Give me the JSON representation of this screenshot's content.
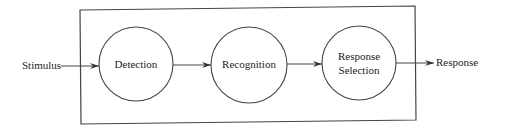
{
  "diagram": {
    "type": "flow",
    "input": {
      "label": "Stimulus"
    },
    "output": {
      "label": "Response"
    },
    "stages": [
      {
        "id": "detection",
        "lines": [
          "Detection"
        ]
      },
      {
        "id": "recognition",
        "lines": [
          "Recognition"
        ]
      },
      {
        "id": "response-selection",
        "lines": [
          "Response",
          "Selection"
        ]
      }
    ],
    "edges": [
      {
        "from": "Stimulus",
        "to": "Detection"
      },
      {
        "from": "Detection",
        "to": "Recognition"
      },
      {
        "from": "Recognition",
        "to": "Response Selection"
      },
      {
        "from": "Response Selection",
        "to": "Response"
      }
    ],
    "colors": {
      "line": "#444444",
      "text": "#222222",
      "background": "#ffffff"
    }
  }
}
